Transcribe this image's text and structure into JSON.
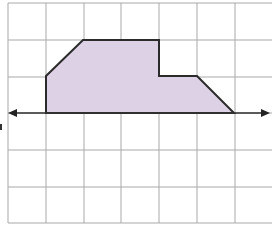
{
  "diagram": {
    "title": "",
    "colors": {
      "background": "#ffffff",
      "grid": "#a9a9a9",
      "shape_fill": "#ddd1e6",
      "shape_stroke": "#2b2b2b",
      "axis": "#333333"
    },
    "grid": {
      "cell_size_px": 37.8,
      "columns": 7,
      "rows": 6,
      "vertical_lines_x": [
        8,
        46,
        84,
        121,
        159,
        197,
        235
      ],
      "horizontal_lines_y": [
        3,
        40,
        77,
        113,
        150,
        187,
        223
      ]
    },
    "shape": {
      "name": "hexagon",
      "vertices_grid_units": [
        [
          1,
          1
        ],
        [
          2,
          2
        ],
        [
          4,
          2
        ],
        [
          4,
          1
        ],
        [
          5,
          1
        ],
        [
          6,
          0
        ]
      ],
      "vertices_px": [
        [
          46,
          113
        ],
        [
          46,
          76
        ],
        [
          83,
          40
        ],
        [
          159,
          40
        ],
        [
          159,
          76
        ],
        [
          197,
          76
        ],
        [
          234,
          113
        ]
      ]
    },
    "axis": {
      "type": "double-arrow-horizontal",
      "y_px": 113,
      "x_start_px": 8,
      "x_end_px": 270
    }
  }
}
